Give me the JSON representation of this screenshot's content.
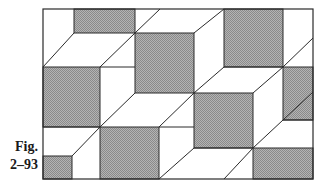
{
  "figure": {
    "label_line1": "Fig.",
    "label_line2": "2–93",
    "frame": {
      "x": 43,
      "y": 9,
      "w": 270,
      "h": 170
    },
    "colors": {
      "shade": "#a8a8a8",
      "line": "#2a2a2a",
      "background": "#ffffff"
    },
    "shaded_squares": [
      {
        "id": "A",
        "x": 74,
        "y": 9,
        "w": 61,
        "h": 24
      },
      {
        "id": "B",
        "x": 43,
        "y": 67,
        "w": 57,
        "h": 60
      },
      {
        "id": "C",
        "x": 135,
        "y": 33,
        "w": 59,
        "h": 60
      },
      {
        "id": "D",
        "x": 224,
        "y": 9,
        "w": 59,
        "h": 58
      },
      {
        "id": "E",
        "x": 283,
        "y": 67,
        "w": 30,
        "h": 53
      },
      {
        "id": "F",
        "x": 194,
        "y": 93,
        "w": 59,
        "h": 55
      },
      {
        "id": "G",
        "x": 253,
        "y": 148,
        "w": 60,
        "h": 31
      },
      {
        "id": "H",
        "x": 100,
        "y": 127,
        "w": 59,
        "h": 52
      },
      {
        "id": "I",
        "x": 43,
        "y": 156,
        "w": 29,
        "h": 23
      }
    ],
    "diagonals": [
      [
        74,
        33,
        43,
        67
      ],
      [
        135,
        33,
        100,
        67
      ],
      [
        135,
        33,
        160,
        9
      ],
      [
        194,
        33,
        224,
        9
      ],
      [
        283,
        67,
        313,
        38
      ],
      [
        194,
        93,
        224,
        67
      ],
      [
        253,
        93,
        283,
        67
      ],
      [
        283,
        120,
        253,
        148
      ],
      [
        283,
        120,
        313,
        92
      ],
      [
        135,
        93,
        100,
        127
      ],
      [
        194,
        93,
        159,
        127
      ],
      [
        100,
        127,
        72,
        156
      ],
      [
        194,
        148,
        159,
        179
      ],
      [
        253,
        148,
        224,
        179
      ]
    ],
    "edges": [
      [
        100,
        67,
        135,
        67
      ],
      [
        224,
        67,
        283,
        67
      ],
      [
        283,
        120,
        313,
        120
      ],
      [
        159,
        127,
        194,
        127
      ],
      [
        194,
        148,
        253,
        148
      ],
      [
        43,
        127,
        100,
        127
      ]
    ]
  }
}
